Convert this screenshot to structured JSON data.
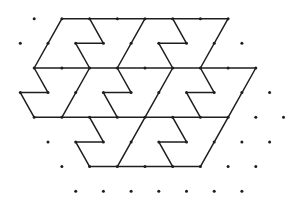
{
  "diagram": {
    "colors": {
      "line": "#1e1e1e",
      "dot": "#1e1e1e",
      "background": "#ffffff"
    },
    "grid": {
      "origin_x": 34.2,
      "origin_y": 18.7,
      "dx": 27.7,
      "dy": 24.65,
      "odd_row_offset": -13.85
    },
    "dots": [
      [
        34.2,
        18.7
      ],
      [
        61.9,
        18.7
      ],
      [
        89.6,
        18.7
      ],
      [
        117.3,
        18.7
      ],
      [
        145.0,
        18.7
      ],
      [
        172.7,
        18.7
      ],
      [
        200.4,
        18.7
      ],
      [
        228.1,
        18.7
      ],
      [
        20.3,
        43.3
      ],
      [
        48.0,
        43.3
      ],
      [
        75.7,
        43.3
      ],
      [
        103.4,
        43.3
      ],
      [
        131.1,
        43.3
      ],
      [
        158.8,
        43.3
      ],
      [
        186.5,
        43.3
      ],
      [
        214.2,
        43.3
      ],
      [
        241.9,
        43.3
      ],
      [
        34.2,
        68.0
      ],
      [
        61.9,
        68.0
      ],
      [
        89.6,
        68.0
      ],
      [
        117.3,
        68.0
      ],
      [
        145.0,
        68.0
      ],
      [
        172.7,
        68.0
      ],
      [
        200.4,
        68.0
      ],
      [
        228.1,
        68.0
      ],
      [
        255.8,
        68.0
      ],
      [
        20.3,
        92.6
      ],
      [
        48.0,
        92.6
      ],
      [
        75.7,
        92.6
      ],
      [
        103.4,
        92.6
      ],
      [
        131.1,
        92.6
      ],
      [
        158.8,
        92.6
      ],
      [
        186.5,
        92.6
      ],
      [
        214.2,
        92.6
      ],
      [
        241.9,
        92.6
      ],
      [
        269.6,
        92.6
      ],
      [
        34.2,
        117.3
      ],
      [
        61.9,
        117.3
      ],
      [
        89.6,
        117.3
      ],
      [
        117.3,
        117.3
      ],
      [
        145.0,
        117.3
      ],
      [
        172.7,
        117.3
      ],
      [
        200.4,
        117.3
      ],
      [
        228.1,
        117.3
      ],
      [
        255.8,
        117.3
      ],
      [
        283.5,
        117.3
      ],
      [
        48.0,
        141.9
      ],
      [
        75.7,
        141.9
      ],
      [
        103.4,
        141.9
      ],
      [
        131.1,
        141.9
      ],
      [
        158.8,
        141.9
      ],
      [
        186.5,
        141.9
      ],
      [
        214.2,
        141.9
      ],
      [
        241.9,
        141.9
      ],
      [
        269.6,
        141.9
      ],
      [
        61.9,
        166.6
      ],
      [
        89.6,
        166.6
      ],
      [
        117.3,
        166.6
      ],
      [
        145.0,
        166.6
      ],
      [
        172.7,
        166.6
      ],
      [
        200.4,
        166.6
      ],
      [
        228.1,
        166.6
      ],
      [
        255.8,
        166.6
      ],
      [
        75.7,
        191.2
      ],
      [
        103.4,
        191.2
      ],
      [
        131.1,
        191.2
      ],
      [
        158.8,
        191.2
      ],
      [
        186.5,
        191.2
      ],
      [
        214.2,
        191.2
      ],
      [
        241.9,
        191.2
      ]
    ],
    "polylines": [
      [
        [
          61.9,
          18.7
        ],
        [
          228.1,
          18.7
        ]
      ],
      [
        [
          61.9,
          18.7
        ],
        [
          34.2,
          68.0
        ]
      ],
      [
        [
          89.6,
          18.7
        ],
        [
          103.4,
          43.3
        ],
        [
          75.7,
          43.3
        ],
        [
          89.6,
          68.0
        ]
      ],
      [
        [
          145.0,
          18.7
        ],
        [
          117.3,
          68.0
        ]
      ],
      [
        [
          172.7,
          18.7
        ],
        [
          186.5,
          43.3
        ],
        [
          158.8,
          43.3
        ],
        [
          172.7,
          68.0
        ]
      ],
      [
        [
          228.1,
          18.7
        ],
        [
          200.4,
          68.0
        ]
      ],
      [
        [
          34.2,
          68.0
        ],
        [
          255.8,
          68.0
        ]
      ],
      [
        [
          34.2,
          68.0
        ],
        [
          48.0,
          92.6
        ],
        [
          20.3,
          92.6
        ],
        [
          34.2,
          117.3
        ]
      ],
      [
        [
          89.6,
          68.0
        ],
        [
          61.9,
          117.3
        ]
      ],
      [
        [
          117.3,
          68.0
        ],
        [
          131.1,
          92.6
        ],
        [
          103.4,
          92.6
        ],
        [
          117.3,
          117.3
        ]
      ],
      [
        [
          172.7,
          68.0
        ],
        [
          145.0,
          117.3
        ]
      ],
      [
        [
          200.4,
          68.0
        ],
        [
          214.2,
          92.6
        ],
        [
          186.5,
          92.6
        ],
        [
          200.4,
          117.3
        ]
      ],
      [
        [
          255.8,
          68.0
        ],
        [
          228.1,
          117.3
        ]
      ],
      [
        [
          34.2,
          117.3
        ],
        [
          228.1,
          117.3
        ]
      ],
      [
        [
          89.6,
          117.3
        ],
        [
          103.4,
          141.9
        ],
        [
          75.7,
          141.9
        ],
        [
          89.6,
          166.6
        ]
      ],
      [
        [
          145.0,
          117.3
        ],
        [
          117.3,
          166.6
        ]
      ],
      [
        [
          172.7,
          117.3
        ],
        [
          186.5,
          141.9
        ],
        [
          158.8,
          141.9
        ],
        [
          172.7,
          166.6
        ]
      ],
      [
        [
          228.1,
          117.3
        ],
        [
          200.4,
          166.6
        ]
      ],
      [
        [
          89.6,
          166.6
        ],
        [
          200.4,
          166.6
        ]
      ]
    ]
  }
}
